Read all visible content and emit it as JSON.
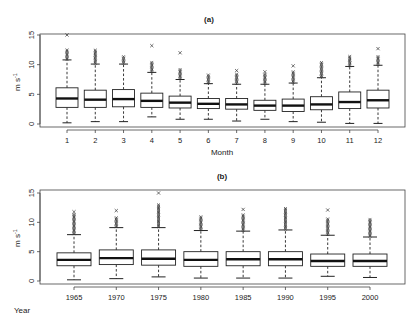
{
  "chart_data": [
    {
      "type": "box",
      "title": "(a)",
      "xlabel": "Month",
      "ylabel": "m s-1",
      "ylim": [
        0,
        15
      ],
      "yticks": [
        0,
        5,
        10,
        15
      ],
      "grid": false,
      "categories": [
        "1",
        "2",
        "3",
        "4",
        "5",
        "6",
        "7",
        "8",
        "9",
        "10",
        "11",
        "12"
      ],
      "boxes": [
        {
          "low": 0.2,
          "q1": 2.8,
          "median": 4.3,
          "q3": 6.1,
          "high": 10.8,
          "out_max": 15.0,
          "out_top": 12.5
        },
        {
          "low": 0.4,
          "q1": 2.8,
          "median": 4.1,
          "q3": 5.7,
          "high": 10.1,
          "out_max": 12.5,
          "out_top": 12.5
        },
        {
          "low": 0.4,
          "q1": 2.9,
          "median": 4.2,
          "q3": 5.8,
          "high": 10.1,
          "out_max": 11.5,
          "out_top": 11.5
        },
        {
          "low": 1.2,
          "q1": 2.8,
          "median": 3.9,
          "q3": 5.2,
          "high": 8.7,
          "out_max": 13.2,
          "out_top": 10.5
        },
        {
          "low": 0.8,
          "q1": 2.7,
          "median": 3.6,
          "q3": 4.7,
          "high": 7.5,
          "out_max": 12.0,
          "out_top": 9.3
        },
        {
          "low": 0.8,
          "q1": 2.6,
          "median": 3.4,
          "q3": 4.3,
          "high": 6.8,
          "out_max": 8.3,
          "out_top": 8.3
        },
        {
          "low": 0.5,
          "q1": 2.5,
          "median": 3.3,
          "q3": 4.3,
          "high": 6.7,
          "out_max": 9.0,
          "out_top": 8.5
        },
        {
          "low": 0.8,
          "q1": 2.3,
          "median": 3.1,
          "q3": 4.0,
          "high": 6.7,
          "out_max": 8.8,
          "out_top": 8.5
        },
        {
          "low": 0.4,
          "q1": 2.1,
          "median": 3.1,
          "q3": 4.2,
          "high": 6.9,
          "out_max": 9.8,
          "out_top": 9.0
        },
        {
          "low": 0.3,
          "q1": 2.4,
          "median": 3.3,
          "q3": 4.6,
          "high": 7.8,
          "out_max": 10.5,
          "out_top": 10.5
        },
        {
          "low": 0.1,
          "q1": 2.6,
          "median": 3.7,
          "q3": 5.4,
          "high": 9.7,
          "out_max": 11.5,
          "out_top": 11.5
        },
        {
          "low": 0.1,
          "q1": 2.7,
          "median": 4.0,
          "q3": 5.7,
          "high": 9.9,
          "out_max": 12.7,
          "out_top": 11.5
        }
      ]
    },
    {
      "type": "box",
      "title": "(b)",
      "xlabel": "Year",
      "ylabel": "m s-1",
      "ylim": [
        0,
        15
      ],
      "yticks": [
        0,
        5,
        10,
        15
      ],
      "grid": false,
      "categories": [
        "1965",
        "1970",
        "1975",
        "1980",
        "1985",
        "1990",
        "1995",
        "2000"
      ],
      "boxes": [
        {
          "low": 0.2,
          "q1": 2.6,
          "median": 3.6,
          "q3": 4.8,
          "high": 7.9,
          "out_max": 11.8,
          "out_top": 11.5
        },
        {
          "low": 0.4,
          "q1": 2.8,
          "median": 3.9,
          "q3": 5.3,
          "high": 9.1,
          "out_max": 12.0,
          "out_top": 11.0
        },
        {
          "low": 0.7,
          "q1": 2.7,
          "median": 3.8,
          "q3": 5.3,
          "high": 9.1,
          "out_max": 15.0,
          "out_top": 13.2
        },
        {
          "low": 0.5,
          "q1": 2.5,
          "median": 3.6,
          "q3": 5.0,
          "high": 8.6,
          "out_max": 11.1,
          "out_top": 11.0
        },
        {
          "low": 0.5,
          "q1": 2.6,
          "median": 3.7,
          "q3": 5.0,
          "high": 8.5,
          "out_max": 12.2,
          "out_top": 11.5
        },
        {
          "low": 0.5,
          "q1": 2.6,
          "median": 3.7,
          "q3": 5.0,
          "high": 8.7,
          "out_max": 12.5,
          "out_top": 12.5
        },
        {
          "low": 0.8,
          "q1": 2.5,
          "median": 3.4,
          "q3": 4.6,
          "high": 7.8,
          "out_max": 12.1,
          "out_top": 10.6
        },
        {
          "low": 0.6,
          "q1": 2.5,
          "median": 3.4,
          "q3": 4.6,
          "high": 7.5,
          "out_max": 10.6,
          "out_top": 10.6
        }
      ]
    }
  ],
  "panels": {
    "a": {
      "title": "(a)",
      "xlabel": "Month",
      "ylabel": "m s",
      "ylabel_sup": "-1",
      "yticks": [
        "0",
        "5",
        "10",
        "15"
      ]
    },
    "b": {
      "title": "(b)",
      "xlabel": "Year",
      "ylabel": "m s",
      "ylabel_sup": "-1",
      "yticks": [
        "0",
        "5",
        "10",
        "15"
      ]
    }
  }
}
